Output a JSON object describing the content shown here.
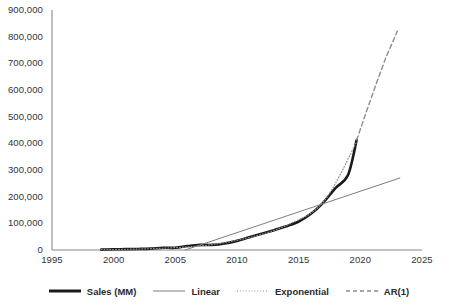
{
  "chart_data": {
    "type": "line",
    "title": "",
    "subtitle": "",
    "xlabel": "",
    "ylabel": "",
    "xlim": [
      1995,
      2025
    ],
    "ylim": [
      0,
      900000
    ],
    "grid": false,
    "legend_position": "bottom",
    "x_ticks": [
      1995,
      2000,
      2005,
      2010,
      2015,
      2020,
      2025
    ],
    "x_tick_labels": [
      "1995",
      "2000",
      "2005",
      "2010",
      "2015",
      "2020",
      "2025"
    ],
    "y_ticks": [
      0,
      100000,
      200000,
      300000,
      400000,
      500000,
      600000,
      700000,
      800000,
      900000
    ],
    "y_tick_labels": [
      "0",
      "100,000",
      "200,000",
      "300,000",
      "400,000",
      "500,000",
      "600,000",
      "700,000",
      "800,000",
      "900,000"
    ],
    "series": [
      {
        "name": "Sales (MM)",
        "style": "solid-thick",
        "color": "#1a1a1a",
        "width": 2.6,
        "x": [
          1999,
          2000,
          2001,
          2002,
          2003,
          2004,
          2005,
          2006,
          2007,
          2008,
          2009,
          2010,
          2011,
          2012,
          2013,
          2014,
          2015,
          2016,
          2017,
          2018,
          2019,
          2019.7
        ],
        "values": [
          1500,
          2800,
          3100,
          3900,
          5300,
          8500,
          8490,
          14800,
          19200,
          19200,
          24500,
          34200,
          48000,
          61000,
          74500,
          88900,
          107000,
          136000,
          178000,
          233000,
          281000,
          412000
        ]
      },
      {
        "name": "Linear",
        "style": "solid-thin",
        "color": "#7d7d7d",
        "width": 1.0,
        "x": [
          2005.8,
          2023.2
        ],
        "values": [
          0,
          270000
        ]
      },
      {
        "name": "Exponential",
        "style": "dotted",
        "color": "#8c8c8c",
        "width": 1.2,
        "x": [
          1999,
          2002,
          2005,
          2008,
          2011,
          2014,
          2017,
          2019.7
        ],
        "values": [
          1400,
          3600,
          9000,
          20500,
          47000,
          92000,
          180000,
          405000
        ]
      },
      {
        "name": "AR(1)",
        "style": "dashed",
        "color": "#8c8c8c",
        "width": 1.4,
        "x": [
          2019.7,
          2020.5,
          2021.3,
          2022.1,
          2023.0
        ],
        "values": [
          412000,
          520000,
          625000,
          725000,
          820000
        ]
      }
    ]
  },
  "legend": {
    "items": [
      {
        "label": "Sales (MM)",
        "swatch": "solid-thick-line-swatch"
      },
      {
        "label": "Linear",
        "swatch": "solid-thin-line-swatch"
      },
      {
        "label": "Exponential",
        "swatch": "dotted-line-swatch"
      },
      {
        "label": "AR(1)",
        "swatch": "dashed-line-swatch"
      }
    ]
  }
}
